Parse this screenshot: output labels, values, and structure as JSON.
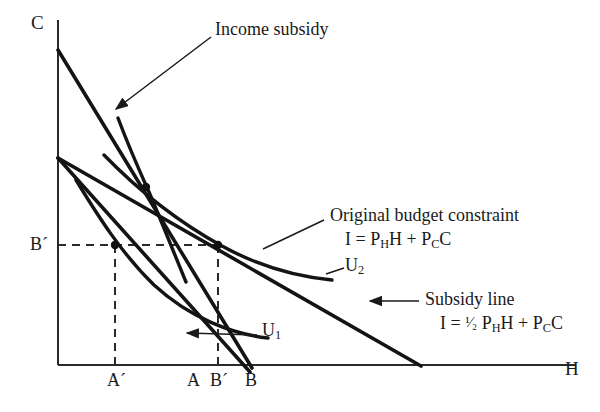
{
  "figure": {
    "type": "economics-indifference-curve-diagram",
    "background_color": "#ffffff",
    "ink_color": "#1a1a1a"
  },
  "axes": {
    "y_label": "C",
    "x_label": "H",
    "origin_px": [
      58,
      365
    ],
    "y_top_px": [
      58,
      20
    ],
    "x_right_px": [
      575,
      365
    ]
  },
  "x_ticks": [
    {
      "label": "A´",
      "x_px": 115
    },
    {
      "label": "A",
      "x_px": 193
    },
    {
      "label": "B´",
      "x_px": 218
    },
    {
      "label": "B",
      "x_px": 250
    }
  ],
  "y_ticks": [
    {
      "label": "B´",
      "y_px": 245
    }
  ],
  "annotations": {
    "income_subsidy": {
      "text": "Income subsidy",
      "x_px": 215,
      "y_px": 22,
      "leader_from": [
        210,
        40
      ],
      "leader_to": [
        115,
        110
      ]
    },
    "original_budget_constraint": {
      "line1": "Original budget constraint",
      "line2_prefix": "I = P",
      "line2_sub1": "H",
      "line2_mid": "H + P",
      "line2_sub2": "C",
      "line2_suffix": "C",
      "x_px": 330,
      "y_px": 212,
      "leader_from": [
        325,
        222
      ],
      "leader_to": [
        264,
        248
      ]
    },
    "subsidy_line": {
      "line1": "Subsidy line",
      "line2_prefix": "I = ",
      "line2_frac": "¹⁄₂",
      "line2_mid1": " P",
      "line2_sub1": "H",
      "line2_mid2": "H + P",
      "line2_sub2": "C",
      "line2_suffix": "C",
      "x_px": 425,
      "y_px": 290,
      "leader_from": [
        418,
        301
      ],
      "leader_to": [
        370,
        301
      ]
    }
  },
  "curves": [
    {
      "name": "U3",
      "kind": "indifference-curve",
      "label": "",
      "label_px": [
        0,
        0
      ]
    },
    {
      "name": "U2",
      "kind": "indifference-curve",
      "label": "U",
      "label_sub": "2",
      "label_px": [
        345,
        262
      ]
    },
    {
      "name": "U1",
      "kind": "indifference-curve",
      "label": "U",
      "label_sub": "1",
      "label_px": [
        262,
        327
      ],
      "leader_from": [
        258,
        336
      ],
      "leader_to": [
        186,
        334
      ]
    }
  ],
  "lines": [
    {
      "name": "income-subsidy-budget-line",
      "from_px": [
        58,
        50
      ],
      "to_px": [
        250,
        365
      ]
    },
    {
      "name": "original-budget-constraint-line",
      "from_px": [
        58,
        158
      ],
      "to_px": [
        250,
        365
      ]
    },
    {
      "name": "subsidy-line",
      "from_px": [
        58,
        158
      ],
      "to_px": [
        420,
        365
      ]
    }
  ],
  "tangency_points": [
    {
      "name": "income-subsidy-optimum",
      "x_px": 146,
      "y_px": 187
    },
    {
      "name": "original-optimum",
      "x_px": 115,
      "y_px": 245
    },
    {
      "name": "price-subsidy-optimum",
      "x_px": 218,
      "y_px": 245
    }
  ],
  "dashed_guides": [
    {
      "name": "horizontal-B-prime",
      "from_px": [
        58,
        245
      ],
      "to_px": [
        218,
        245
      ]
    },
    {
      "name": "vertical-A-prime",
      "from_px": [
        115,
        245
      ],
      "to_px": [
        115,
        365
      ]
    },
    {
      "name": "vertical-B-prime",
      "from_px": [
        218,
        245
      ],
      "to_px": [
        218,
        365
      ]
    }
  ]
}
